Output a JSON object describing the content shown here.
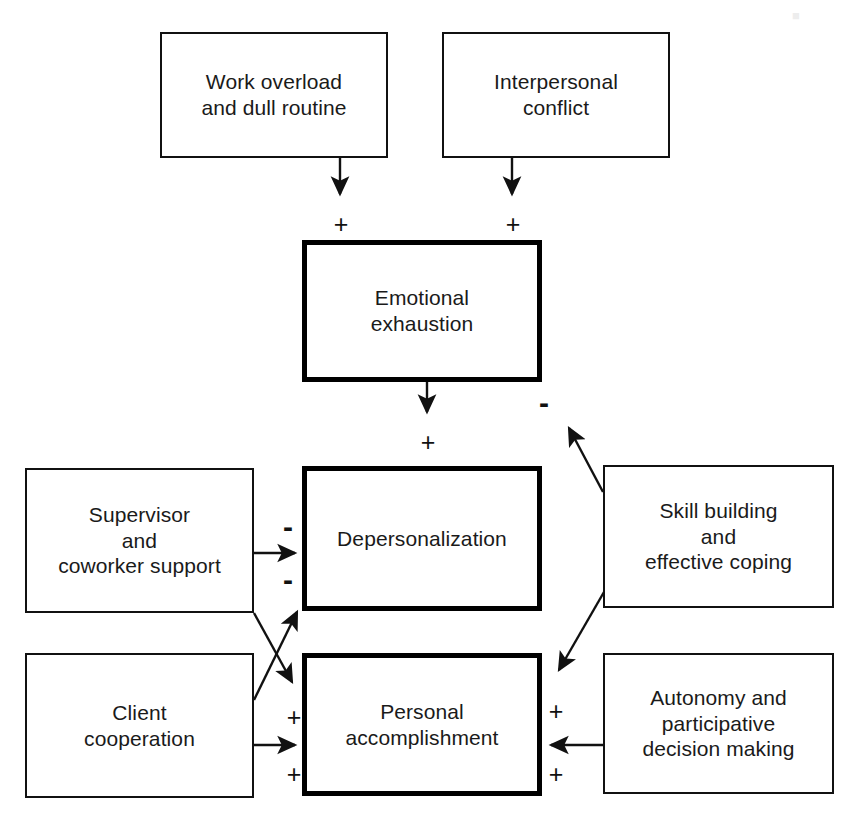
{
  "diagram": {
    "background_color": "#ffffff",
    "line_color": "#111111",
    "nodes": [
      {
        "id": "work_overload",
        "label": "Work overload\nand dull routine",
        "emphasis": "normal",
        "x": 160,
        "y": 32,
        "w": 228,
        "h": 126
      },
      {
        "id": "interpersonal",
        "label": "Interpersonal\nconflict",
        "emphasis": "normal",
        "x": 442,
        "y": 32,
        "w": 228,
        "h": 126
      },
      {
        "id": "emotional_exhaustion",
        "label": "Emotional\nexhaustion",
        "emphasis": "bold",
        "x": 302,
        "y": 240,
        "w": 240,
        "h": 142
      },
      {
        "id": "supervisor_support",
        "label": "Supervisor\nand\ncoworker support",
        "emphasis": "normal",
        "x": 25,
        "y": 468,
        "w": 229,
        "h": 145
      },
      {
        "id": "depersonalization",
        "label": "Depersonalization",
        "emphasis": "bold",
        "x": 302,
        "y": 466,
        "w": 240,
        "h": 145
      },
      {
        "id": "skill_building",
        "label": "Skill building\nand\neffective coping",
        "emphasis": "normal",
        "x": 603,
        "y": 465,
        "w": 231,
        "h": 143
      },
      {
        "id": "client_cooperation",
        "label": "Client\ncooperation",
        "emphasis": "normal",
        "x": 25,
        "y": 653,
        "w": 229,
        "h": 145
      },
      {
        "id": "personal_accomp",
        "label": "Personal\naccomplishment",
        "emphasis": "bold",
        "x": 302,
        "y": 653,
        "w": 240,
        "h": 143
      },
      {
        "id": "autonomy",
        "label": "Autonomy and\nparticipative\ndecision making",
        "emphasis": "normal",
        "x": 603,
        "y": 653,
        "w": 231,
        "h": 141
      }
    ],
    "signs": [
      {
        "id": "sign-work-to-exhaustion",
        "symbol": "+",
        "x": 330,
        "y": 212
      },
      {
        "id": "sign-conflict-to-exhaustion",
        "symbol": "+",
        "x": 502,
        "y": 212
      },
      {
        "id": "sign-skill-to-exhaustion",
        "symbol": "-",
        "x": 533,
        "y": 388
      },
      {
        "id": "sign-exhaustion-to-deperson",
        "symbol": "+",
        "x": 417,
        "y": 430
      },
      {
        "id": "sign-supervisor-to-deperson",
        "symbol": "-",
        "x": 277,
        "y": 512
      },
      {
        "id": "sign-client-to-deperson",
        "symbol": "-",
        "x": 277,
        "y": 565
      },
      {
        "id": "sign-supervisor-to-personal",
        "symbol": "+",
        "x": 283,
        "y": 705
      },
      {
        "id": "sign-client-to-personal",
        "symbol": "+",
        "x": 283,
        "y": 762
      },
      {
        "id": "sign-skill-to-personal",
        "symbol": "+",
        "x": 545,
        "y": 699
      },
      {
        "id": "sign-autonomy-to-personal",
        "symbol": "+",
        "x": 545,
        "y": 762
      }
    ],
    "edges": [
      {
        "id": "work-to-exhaustion",
        "from": "work_overload",
        "to": "emotional_exhaustion",
        "kind": "arrow-down",
        "sign": "+"
      },
      {
        "id": "conflict-to-exhaustion",
        "from": "interpersonal",
        "to": "emotional_exhaustion",
        "kind": "arrow-down",
        "sign": "+"
      },
      {
        "id": "exhaustion-to-deperson",
        "from": "emotional_exhaustion",
        "to": "depersonalization",
        "kind": "arrow-down",
        "sign": "+"
      },
      {
        "id": "supervisor-to-deperson",
        "from": "supervisor_support",
        "to": "depersonalization",
        "kind": "arrow-right",
        "sign": "-"
      },
      {
        "id": "client-to-deperson",
        "from": "client_cooperation",
        "to": "depersonalization",
        "kind": "arrow-diag-up",
        "sign": "-"
      },
      {
        "id": "supervisor-to-personal",
        "from": "supervisor_support",
        "to": "personal_accomp",
        "kind": "arrow-diag-down",
        "sign": "+"
      },
      {
        "id": "client-to-personal",
        "from": "client_cooperation",
        "to": "personal_accomp",
        "kind": "arrow-right",
        "sign": "+"
      },
      {
        "id": "skill-to-exhaustion",
        "from": "skill_building",
        "to": "emotional_exhaustion",
        "kind": "arrow-diag-up",
        "sign": "-"
      },
      {
        "id": "skill-to-personal",
        "from": "skill_building",
        "to": "personal_accomp",
        "kind": "arrow-diag-down",
        "sign": "+"
      },
      {
        "id": "autonomy-to-personal",
        "from": "autonomy",
        "to": "personal_accomp",
        "kind": "arrow-left",
        "sign": "+"
      }
    ]
  }
}
